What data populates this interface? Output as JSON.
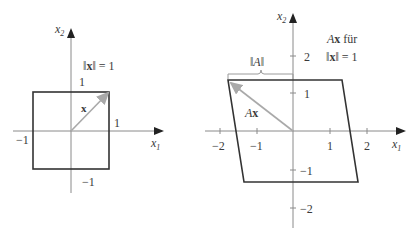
{
  "colors": {
    "axis": "#8a8a8a",
    "frame": "#333333",
    "vector": "#a9a9a9",
    "text": "#3a3a3a"
  },
  "left_panel": {
    "axis_x_label": "x",
    "axis_x_sub": "1",
    "axis_y_label": "x",
    "axis_y_sub": "2",
    "norm_label_open": "‖",
    "norm_label_var": "x",
    "norm_label_close": "‖ = 1",
    "vector_label": "x",
    "tick_top": "1",
    "tick_right": "1",
    "tick_left": "−1",
    "tick_bottom": "−1",
    "shape": "square",
    "vertices": [
      [
        -1,
        1
      ],
      [
        1,
        1
      ],
      [
        1,
        -1
      ],
      [
        -1,
        -1
      ]
    ],
    "vector": [
      1,
      1
    ]
  },
  "right_panel": {
    "axis_x_label": "x",
    "axis_x_sub": "1",
    "axis_y_label": "x",
    "axis_y_sub": "2",
    "caption_line1_A": "A",
    "caption_line1_x": "x",
    "caption_line1_rest": " für",
    "caption_line2_open": "‖",
    "caption_line2_var": "x",
    "caption_line2_close": "‖ = 1",
    "brace_label": "‖A‖",
    "vector_label_A": "A",
    "vector_label_x": "x",
    "x_ticks": [
      "−2",
      "−1",
      "1",
      "2"
    ],
    "y_ticks": [
      "2",
      "1",
      "−1",
      "−2"
    ],
    "shape": "parallelogram",
    "vertices": [
      [
        -1.75,
        1.38
      ],
      [
        1.35,
        1.38
      ],
      [
        1.75,
        -1.38
      ],
      [
        -1.35,
        -1.38
      ]
    ],
    "vector": [
      -1.72,
      1.32
    ]
  }
}
